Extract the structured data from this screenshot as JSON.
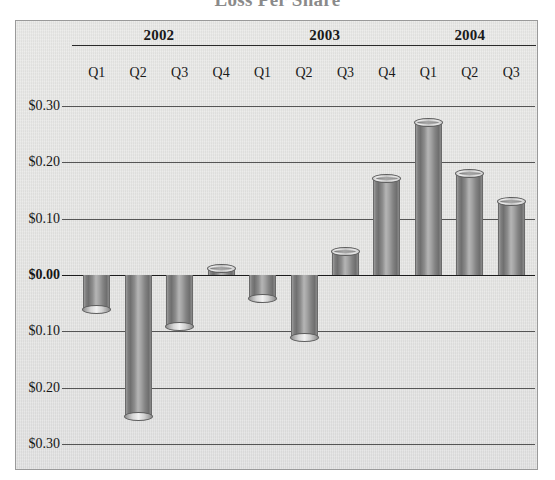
{
  "chart_title": "Loss Per Share",
  "chart_data": {
    "type": "bar",
    "title": "Loss Per Share",
    "xlabel": "",
    "ylabel": "",
    "grid": true,
    "legend": "none",
    "orientation": "vertical",
    "bar_style": "3d-cylinder",
    "ylim": [
      -0.3,
      0.3
    ],
    "ytick_values": [
      0.3,
      0.2,
      0.1,
      0.0,
      -0.1,
      -0.2,
      -0.3
    ],
    "ytick_labels": [
      "$0.30",
      "$0.20",
      "$0.10",
      "$0.00",
      "$0.10",
      "$0.20",
      "$0.30"
    ],
    "zero_tick_label": "$0.00",
    "year_groups": [
      {
        "year": "2002",
        "quarters": [
          "Q1",
          "Q2",
          "Q3",
          "Q4"
        ]
      },
      {
        "year": "2003",
        "quarters": [
          "Q1",
          "Q2",
          "Q3",
          "Q4"
        ]
      },
      {
        "year": "2004",
        "quarters": [
          "Q1",
          "Q2",
          "Q3"
        ]
      }
    ],
    "categories": [
      "2002 Q1",
      "2002 Q2",
      "2002 Q3",
      "2002 Q4",
      "2003 Q1",
      "2003 Q2",
      "2003 Q3",
      "2003 Q4",
      "2004 Q1",
      "2004 Q2",
      "2004 Q3"
    ],
    "values": [
      -0.06,
      -0.25,
      -0.09,
      0.01,
      -0.04,
      -0.11,
      0.04,
      0.17,
      0.27,
      0.18,
      0.13
    ]
  },
  "colors": {
    "panel_background": "#e3e3e1",
    "bar_fill": "#8a8a8a",
    "bar_highlight": "#b5b5b5",
    "bar_shadow": "#6f6f6f",
    "gridline": "#555555",
    "zero_line": "#1d1d1d",
    "text": "#161616",
    "panel_border": "#9a9a9a"
  }
}
